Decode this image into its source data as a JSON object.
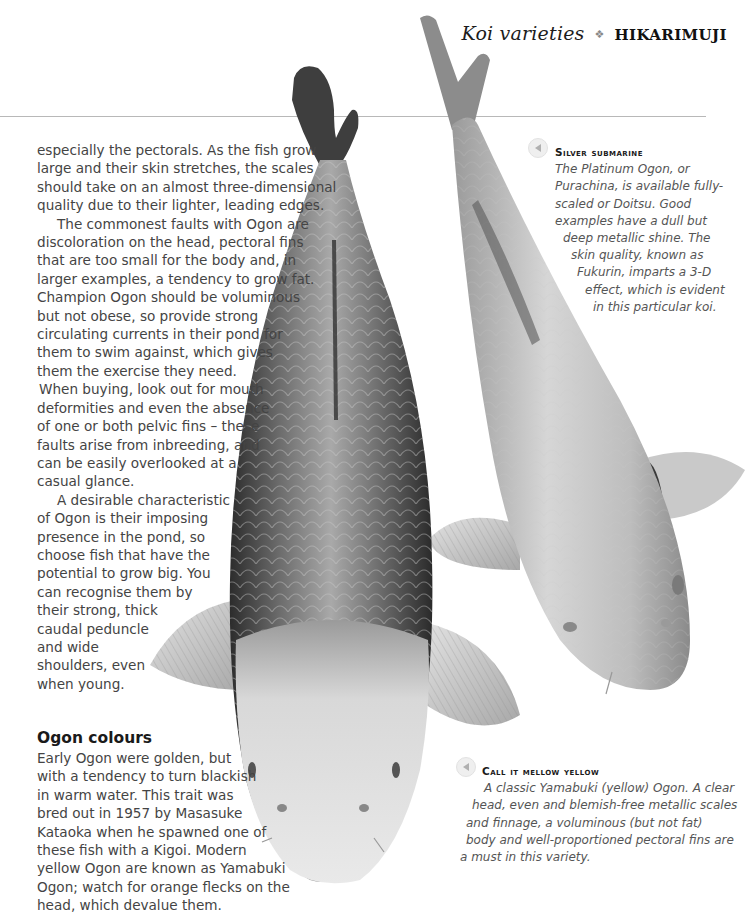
{
  "header": {
    "section": "Koi varieties",
    "separator_icon": "fleuron-icon",
    "separator_glyph": "❖",
    "chapter": "HIKARIMUJI"
  },
  "main": {
    "column_lines": [
      "especially the pectorals. As the fish grow",
      "large and their skin stretches, the scales",
      "should take on an almost three-dimensional",
      "quality due to their lighter, leading edges.",
      "The commonest faults with Ogon are",
      "discoloration on the head, pectoral fins",
      "that are too small for the body and, in",
      "larger examples, a tendency to grow fat.",
      "Champion Ogon should be voluminous",
      "but not obese, so provide strong",
      "circulating currents in their pond for",
      "them to swim against, which gives",
      "them the exercise they need.",
      "When buying, look out for mouth",
      "deformities and even the absence",
      "of one or both pelvic fins – these",
      "faults arise from inbreeding, and",
      "can be easily overlooked at a",
      "casual glance.",
      "A desirable characteristic",
      "of Ogon is their imposing",
      "presence in the pond, so",
      "choose fish that have the",
      "potential to grow big. You",
      "can recognise them by",
      "their strong, thick",
      "caudal peduncle",
      "and wide",
      "shoulders, even",
      "when young."
    ],
    "subheading": "Ogon colours",
    "colours_lines": [
      "Early Ogon were golden, but",
      "with a tendency to turn blackish",
      "in warm water. This trait was",
      "bred out in 1957 by Masasuke",
      "Kataoka when he spawned one of",
      "these fish with a Kigoi. Modern",
      "yellow Ogon are known as Yamabuki",
      "Ogon; watch for orange flecks on the",
      "head, which devalue them."
    ]
  },
  "captions": [
    {
      "icon": "arrow-left-icon",
      "title": "Silver submarine",
      "lines": [
        "The Platinum Ogon, or",
        "Purachina, is available fully-",
        "scaled or Doitsu. Good",
        "examples have a dull but",
        "deep metallic shine. The",
        "skin quality, known as",
        "Fukurin, imparts a 3-D",
        "effect, which is evident",
        "in this particular koi."
      ]
    },
    {
      "icon": "arrow-left-icon",
      "title": "Call it mellow yellow",
      "lines": [
        "A classic Yamabuki (yellow) Ogon. A clear",
        "head, even and blemish-free metallic scales",
        "and finnage, a voluminous (but not fat)",
        "body and well-proportioned pectoral fins are",
        "a must in this variety."
      ]
    }
  ],
  "images": [
    {
      "name": "yamabuki-ogon-koi-photo",
      "description": "Yamabuki Ogon koi viewed from above, head down"
    },
    {
      "name": "platinum-ogon-koi-photo",
      "description": "Platinum Ogon koi viewed from above, head down-right"
    }
  ],
  "colors": {
    "rule": "#b8b8b8",
    "body_text": "#444444",
    "heading": "#1a1a1a"
  }
}
